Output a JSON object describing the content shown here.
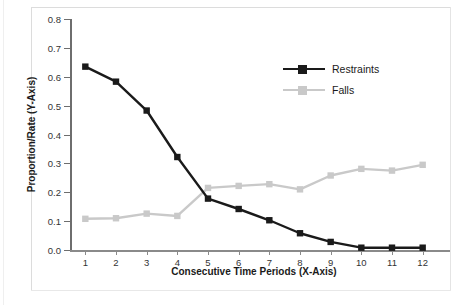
{
  "chart_data": {
    "type": "line",
    "title": "",
    "xlabel": "Consecutive Time Periods (X-Axis)",
    "ylabel": "Proportion/Rate (Y-Axis)",
    "categories": [
      "1",
      "2",
      "3",
      "4",
      "5",
      "6",
      "7",
      "8",
      "9",
      "10",
      "11",
      "12"
    ],
    "x": [
      1,
      2,
      3,
      4,
      5,
      6,
      7,
      8,
      9,
      10,
      11,
      12
    ],
    "xlim": [
      0.5,
      12.5
    ],
    "ylim": [
      0.0,
      0.8
    ],
    "ytick_labels": [
      "0.0",
      "0.1",
      "0.2",
      "0.3",
      "0.4",
      "0.5",
      "0.6",
      "0.7",
      "0.8"
    ],
    "ytick_values": [
      0.0,
      0.1,
      0.2,
      0.3,
      0.4,
      0.5,
      0.6,
      0.7,
      0.8
    ],
    "grid": false,
    "legend_position": "upper right",
    "series": [
      {
        "name": "Restraints",
        "color": "#1a1a1a",
        "marker": "square",
        "values": [
          0.635,
          0.583,
          0.483,
          0.322,
          0.178,
          0.142,
          0.103,
          0.058,
          0.028,
          0.008,
          0.008,
          0.008
        ]
      },
      {
        "name": "Falls",
        "color": "#c9c9c9",
        "marker": "square",
        "values": [
          0.108,
          0.11,
          0.126,
          0.118,
          0.215,
          0.222,
          0.228,
          0.21,
          0.258,
          0.281,
          0.275,
          0.295
        ]
      }
    ]
  },
  "legend": {
    "items": [
      {
        "label": "Restraints",
        "color": "#1a1a1a"
      },
      {
        "label": "Falls",
        "color": "#c9c9c9"
      }
    ]
  }
}
